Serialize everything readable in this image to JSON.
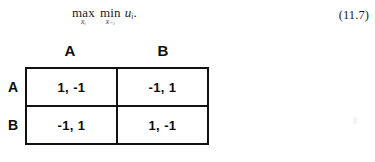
{
  "equation": {
    "outer_operator": "max",
    "outer_subscript": "xᵢ",
    "inner_operator": "min",
    "inner_subscript": "x₋ᵢ",
    "objective": "u",
    "objective_subscript": "i",
    "period": ".",
    "number": "(11.7)"
  },
  "matrix": {
    "column_headers": [
      "A",
      "B"
    ],
    "row_headers": [
      "A",
      "B"
    ],
    "cells": [
      [
        "1, -1",
        "-1, 1"
      ],
      [
        "-1, 1",
        "1, -1"
      ]
    ],
    "border_color": "#111111",
    "text_color": "#0d0d0d",
    "background": "#ffffff"
  }
}
